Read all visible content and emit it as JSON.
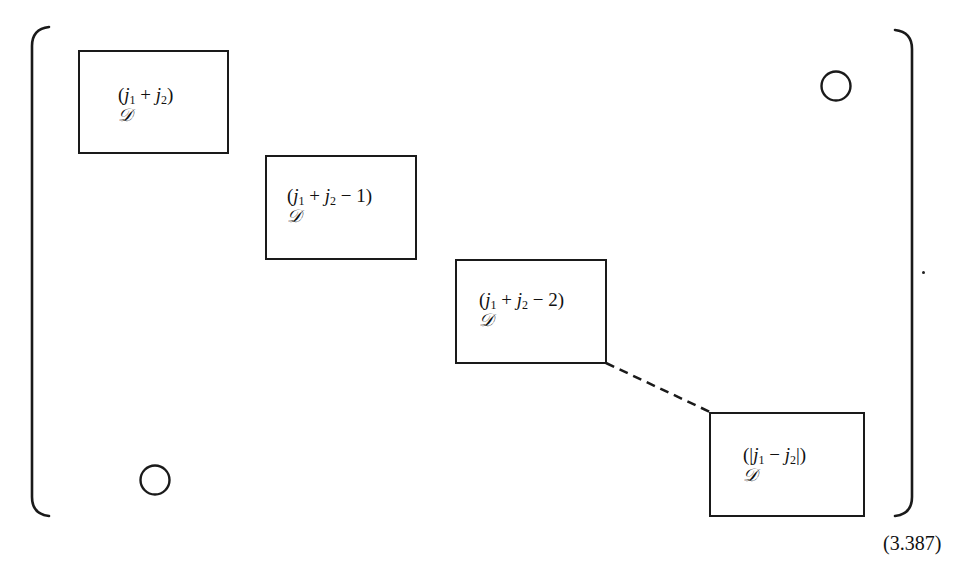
{
  "figure": {
    "type": "block-diagonal-matrix",
    "blocks": [
      {
        "index": 0,
        "label_math": "(j1 + j2)",
        "symbol": "𝒟",
        "parts": {
          "open": "(",
          "a": "j",
          "a_sub": "1",
          "op": " + ",
          "b": "j",
          "b_sub": "2",
          "tail": "",
          "close": ")"
        }
      },
      {
        "index": 1,
        "label_math": "(j1 + j2 − 1)",
        "symbol": "𝒟",
        "parts": {
          "open": "(",
          "a": "j",
          "a_sub": "1",
          "op": " + ",
          "b": "j",
          "b_sub": "2",
          "tail": " − 1",
          "close": ")"
        }
      },
      {
        "index": 2,
        "label_math": "(j1 + j2 − 2)",
        "symbol": "𝒟",
        "parts": {
          "open": "(",
          "a": "j",
          "a_sub": "1",
          "op": " + ",
          "b": "j",
          "b_sub": "2",
          "tail": " − 2",
          "close": ")"
        }
      },
      {
        "index": 3,
        "label_math": "(|j1 − j2|)",
        "symbol": "𝒟",
        "parts": {
          "open": "(|",
          "a": "j",
          "a_sub": "1",
          "op": " − ",
          "b": "j",
          "b_sub": "2",
          "tail": "|",
          "close": ")"
        }
      }
    ],
    "zero_markers": [
      {
        "position": "upper-right",
        "symbol": "○"
      },
      {
        "position": "lower-left",
        "symbol": "○"
      }
    ],
    "continuation": "dashed-line",
    "trailing_punctuation": ".",
    "equation_number": "(3.387)"
  }
}
